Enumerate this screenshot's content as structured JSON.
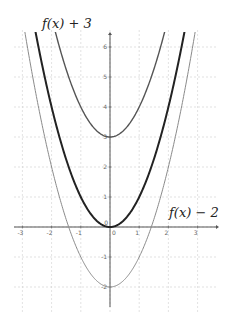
{
  "chart_data": {
    "type": "line",
    "title": "",
    "xlabel": "",
    "ylabel": "",
    "xlim": [
      -3.3,
      3.6
    ],
    "ylim": [
      -2.7,
      6.5
    ],
    "grid": true,
    "x_ticks": [
      -3,
      -2,
      -1,
      0,
      1,
      2,
      3
    ],
    "y_ticks": [
      -2,
      -1,
      0,
      1,
      2,
      3,
      4,
      5,
      6
    ],
    "series": [
      {
        "name": "f(x)",
        "expression": "x^2",
        "vertex": [
          0,
          0
        ],
        "color": "#222222",
        "stroke_width": 2
      },
      {
        "name": "f(x) + 3",
        "expression": "x^2 + 3",
        "vertex": [
          0,
          3
        ],
        "color": "#555555",
        "stroke_width": 1.4
      },
      {
        "name": "f(x) - 2",
        "expression": "x^2 - 2",
        "vertex": [
          0,
          -2
        ],
        "color": "#8a8a8a",
        "stroke_width": 1
      }
    ],
    "annotations": [
      {
        "text": "f(x) + 3",
        "position": "top-left"
      },
      {
        "text": "f(x) − 2",
        "position": "right, near y=1"
      }
    ]
  },
  "labels": {
    "upper": "f(x) + 3",
    "lower": "f(x) − 2"
  },
  "layout": {
    "origin_px": [
      110,
      227
    ],
    "x_unit_px": 29.2,
    "y_unit_px": 30
  }
}
